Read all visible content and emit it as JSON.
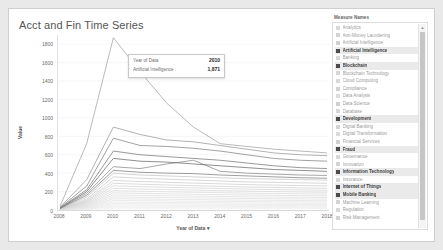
{
  "viz": {
    "title": "Acct and Fin Time Series"
  },
  "tooltip": {
    "row1_key": "Year of Data",
    "row1_value": "2010",
    "row2_key": "Artificial Intelligence :",
    "row2_value": "1,871"
  },
  "legend": {
    "title": "Measure Names",
    "scroll_up_icon": "scroll-up-icon",
    "items": [
      {
        "label": "Analytics",
        "selected": false,
        "color": "#d8d8d8"
      },
      {
        "label": "Anti-Money Laundering",
        "selected": false,
        "color": "#d3d3d3"
      },
      {
        "label": "Artificial Intelligence",
        "selected": false,
        "color": "#cfcfcf"
      },
      {
        "label": "Artificial Intelligence",
        "selected": true,
        "color": "#9a9a9a"
      },
      {
        "label": "Banking",
        "selected": false,
        "color": "#d6d6d6"
      },
      {
        "label": "Blockchain",
        "selected": true,
        "color": "#8e8e8e"
      },
      {
        "label": "Blockchain Technology",
        "selected": false,
        "color": "#d4d4d4"
      },
      {
        "label": "Cloud Computing",
        "selected": false,
        "color": "#d9d9d9"
      },
      {
        "label": "Compliance",
        "selected": false,
        "color": "#d2d2d2"
      },
      {
        "label": "Data Analysis",
        "selected": false,
        "color": "#dcdcdc"
      },
      {
        "label": "Data Science",
        "selected": false,
        "color": "#d0d0d0"
      },
      {
        "label": "Database",
        "selected": false,
        "color": "#d7d7d7"
      },
      {
        "label": "Development",
        "selected": true,
        "color": "#767676"
      },
      {
        "label": "Digital Banking",
        "selected": false,
        "color": "#d5d5d5"
      },
      {
        "label": "Digital Transformation",
        "selected": false,
        "color": "#dadada"
      },
      {
        "label": "Financial Services",
        "selected": false,
        "color": "#d1d1d1"
      },
      {
        "label": "Fraud",
        "selected": true,
        "color": "#828282"
      },
      {
        "label": "Governance",
        "selected": false,
        "color": "#d8d8d8"
      },
      {
        "label": "Innovation",
        "selected": false,
        "color": "#d3d3d3"
      },
      {
        "label": "Information Technology",
        "selected": true,
        "color": "#6f6f6f"
      },
      {
        "label": "Insurance",
        "selected": false,
        "color": "#d6d6d6"
      },
      {
        "label": "Internet of Things",
        "selected": true,
        "color": "#8a8a8a"
      },
      {
        "label": "Mobile Banking",
        "selected": true,
        "color": "#7d7d7d"
      },
      {
        "label": "Machine Learning",
        "selected": false,
        "color": "#d4d4d4"
      },
      {
        "label": "Regulation",
        "selected": false,
        "color": "#d9d9d9"
      },
      {
        "label": "Risk Management",
        "selected": false,
        "color": "#d2d2d2"
      }
    ]
  },
  "chart_data": {
    "type": "line",
    "title": "Acct and Fin Time Series",
    "xlabel": "Year of Data",
    "ylabel": "Value",
    "x": [
      2008,
      2009,
      2010,
      2011,
      2012,
      2013,
      2014,
      2015,
      2016,
      2017,
      2018
    ],
    "xtick_labels": [
      "2008",
      "2009",
      "2010",
      "2011",
      "2012",
      "2013",
      "2014",
      "2015",
      "2016",
      "2017",
      "2018"
    ],
    "ylim": [
      0,
      1900
    ],
    "ytick_labels": [
      "1800",
      "1600",
      "1400",
      "1200",
      "1000",
      "800",
      "600",
      "400",
      "200",
      "0"
    ],
    "yticks": [
      1800,
      1600,
      1400,
      1200,
      1000,
      800,
      600,
      400,
      200,
      0
    ],
    "grid": true,
    "legend_position": "right",
    "annotations": [
      {
        "x": 2010,
        "y": 1871,
        "series": "Artificial Intelligence",
        "text": "1,871"
      }
    ],
    "series": [
      {
        "name": "Artificial Intelligence",
        "color": "#a8a8a8",
        "values": [
          40,
          720,
          1871,
          1500,
          1160,
          900,
          720,
          690,
          660,
          640,
          620
        ]
      },
      {
        "name": "Blockchain",
        "color": "#9e9e9e",
        "values": [
          30,
          330,
          900,
          820,
          760,
          740,
          700,
          660,
          620,
          600,
          590
        ]
      },
      {
        "name": "Development",
        "color": "#8a8a8a",
        "values": [
          25,
          260,
          780,
          700,
          690,
          670,
          640,
          600,
          560,
          540,
          530
        ]
      },
      {
        "name": "Fraud",
        "color": "#7e7e7e",
        "values": [
          22,
          220,
          640,
          600,
          580,
          560,
          540,
          510,
          480,
          460,
          450
        ]
      },
      {
        "name": "Information Technology",
        "color": "#727272",
        "values": [
          20,
          200,
          560,
          530,
          520,
          500,
          480,
          460,
          440,
          430,
          420
        ]
      },
      {
        "name": "Internet of Things",
        "color": "#8f8f8f",
        "values": [
          18,
          180,
          470,
          450,
          500,
          540,
          420,
          400,
          390,
          380,
          375
        ]
      },
      {
        "name": "Mobile Banking",
        "color": "#858585",
        "values": [
          16,
          160,
          430,
          410,
          400,
          395,
          380,
          370,
          360,
          350,
          345
        ]
      },
      {
        "name": "Analytics",
        "color": "#c8c8c8",
        "values": [
          14,
          140,
          400,
          380,
          370,
          360,
          350,
          340,
          335,
          330,
          325
        ]
      },
      {
        "name": "Anti-Money Laundering",
        "color": "#cccccc",
        "values": [
          12,
          120,
          360,
          345,
          335,
          325,
          315,
          305,
          300,
          295,
          290
        ]
      },
      {
        "name": "Banking",
        "color": "#cfcfcf",
        "values": [
          11,
          105,
          320,
          310,
          300,
          292,
          284,
          276,
          270,
          266,
          262
        ]
      },
      {
        "name": "Blockchain Technology",
        "color": "#d2d2d2",
        "values": [
          10,
          95,
          290,
          280,
          272,
          264,
          256,
          250,
          245,
          240,
          236
        ]
      },
      {
        "name": "Cloud Computing",
        "color": "#d5d5d5",
        "values": [
          9,
          85,
          262,
          254,
          246,
          240,
          233,
          227,
          222,
          218,
          214
        ]
      },
      {
        "name": "Compliance",
        "color": "#d8d8d8",
        "values": [
          8,
          75,
          236,
          228,
          222,
          216,
          210,
          205,
          200,
          196,
          193
        ]
      },
      {
        "name": "Data Analysis",
        "color": "#dadada",
        "values": [
          7,
          66,
          210,
          204,
          198,
          193,
          188,
          183,
          179,
          176,
          173
        ]
      },
      {
        "name": "Data Science",
        "color": "#dcdcdc",
        "values": [
          6,
          58,
          186,
          181,
          176,
          171,
          167,
          163,
          159,
          156,
          154
        ]
      },
      {
        "name": "Database",
        "color": "#dedede",
        "values": [
          6,
          50,
          163,
          159,
          155,
          151,
          147,
          143,
          140,
          138,
          136
        ]
      },
      {
        "name": "Digital Banking",
        "color": "#e0e0e0",
        "values": [
          5,
          43,
          142,
          138,
          135,
          131,
          128,
          125,
          122,
          120,
          118
        ]
      },
      {
        "name": "Digital Transformation",
        "color": "#e2e2e2",
        "values": [
          4,
          36,
          122,
          119,
          116,
          113,
          110,
          107,
          105,
          103,
          101
        ]
      },
      {
        "name": "Financial Services",
        "color": "#e4e4e4",
        "values": [
          4,
          30,
          104,
          101,
          99,
          96,
          94,
          92,
          90,
          88,
          87
        ]
      },
      {
        "name": "Governance",
        "color": "#e6e6e6",
        "values": [
          3,
          24,
          86,
          84,
          82,
          80,
          78,
          76,
          75,
          74,
          73
        ]
      },
      {
        "name": "Innovation",
        "color": "#e8e8e8",
        "values": [
          3,
          19,
          70,
          68,
          67,
          65,
          64,
          62,
          61,
          60,
          59
        ]
      },
      {
        "name": "Insurance",
        "color": "#eaeaea",
        "values": [
          2,
          15,
          55,
          54,
          53,
          52,
          51,
          50,
          49,
          48,
          47
        ]
      },
      {
        "name": "Machine Learning",
        "color": "#ececec",
        "values": [
          2,
          11,
          42,
          41,
          40,
          39,
          39,
          38,
          37,
          37,
          36
        ]
      },
      {
        "name": "Regulation",
        "color": "#eeeeee",
        "values": [
          1,
          8,
          30,
          29,
          29,
          28,
          28,
          27,
          27,
          26,
          26
        ]
      },
      {
        "name": "Risk Management",
        "color": "#f0f0f0",
        "values": [
          1,
          5,
          19,
          19,
          18,
          18,
          18,
          17,
          17,
          17,
          16
        ]
      }
    ]
  }
}
